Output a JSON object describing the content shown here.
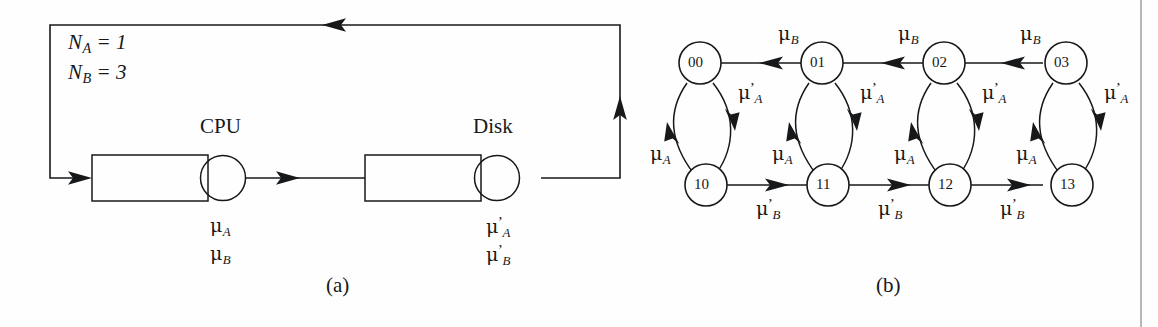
{
  "figure": {
    "panels": [
      {
        "id": "a",
        "caption": "(a)",
        "type": "closed-queueing-network",
        "population_labels": [
          {
            "name": "N_A",
            "text": "N",
            "subscript": "A",
            "equals": "= 1",
            "value": 1
          },
          {
            "name": "N_B",
            "text": "N",
            "subscript": "B",
            "equals": "= 3",
            "value": 3
          }
        ],
        "stations": [
          {
            "name": "CPU",
            "label": "CPU",
            "rates": [
              {
                "base": "μ",
                "subscript": "A",
                "prime": false,
                "display": "μA"
              },
              {
                "base": "μ",
                "subscript": "B",
                "prime": false,
                "display": "μB"
              }
            ]
          },
          {
            "name": "Disk",
            "label": "Disk",
            "rates": [
              {
                "base": "μ",
                "subscript": "A",
                "prime": true,
                "display": "μ'A"
              },
              {
                "base": "μ",
                "subscript": "B",
                "prime": true,
                "display": "μ'B"
              }
            ]
          }
        ]
      },
      {
        "id": "b",
        "caption": "(b)",
        "type": "markov-state-transition-diagram",
        "nodes": [
          {
            "id": "00",
            "label": "00",
            "row": "top",
            "col": 0
          },
          {
            "id": "01",
            "label": "01",
            "row": "top",
            "col": 1
          },
          {
            "id": "02",
            "label": "02",
            "row": "top",
            "col": 2
          },
          {
            "id": "03",
            "label": "03",
            "row": "top",
            "col": 3
          },
          {
            "id": "10",
            "label": "10",
            "row": "bottom",
            "col": 0
          },
          {
            "id": "11",
            "label": "11",
            "row": "bottom",
            "col": 1
          },
          {
            "id": "12",
            "label": "12",
            "row": "bottom",
            "col": 2
          },
          {
            "id": "13",
            "label": "13",
            "row": "bottom",
            "col": 3
          }
        ],
        "edges": [
          {
            "from": "01",
            "to": "00",
            "label": "μB",
            "base": "μ",
            "subscript": "B",
            "prime": false
          },
          {
            "from": "02",
            "to": "01",
            "label": "μB",
            "base": "μ",
            "subscript": "B",
            "prime": false
          },
          {
            "from": "03",
            "to": "02",
            "label": "μB",
            "base": "μ",
            "subscript": "B",
            "prime": false
          },
          {
            "from": "10",
            "to": "11",
            "label": "μ'B",
            "base": "μ",
            "subscript": "B",
            "prime": true
          },
          {
            "from": "11",
            "to": "12",
            "label": "μ'B",
            "base": "μ",
            "subscript": "B",
            "prime": true
          },
          {
            "from": "12",
            "to": "13",
            "label": "μ'B",
            "base": "μ",
            "subscript": "B",
            "prime": true
          },
          {
            "from": "00",
            "to": "10",
            "label": "μ'A",
            "base": "μ",
            "subscript": "A",
            "prime": true
          },
          {
            "from": "01",
            "to": "11",
            "label": "μ'A",
            "base": "μ",
            "subscript": "A",
            "prime": true
          },
          {
            "from": "02",
            "to": "12",
            "label": "μ'A",
            "base": "μ",
            "subscript": "A",
            "prime": true
          },
          {
            "from": "03",
            "to": "13",
            "label": "μ'A",
            "base": "μ",
            "subscript": "A",
            "prime": true
          },
          {
            "from": "10",
            "to": "00",
            "label": "μA",
            "base": "μ",
            "subscript": "A",
            "prime": false
          },
          {
            "from": "11",
            "to": "01",
            "label": "μA",
            "base": "μ",
            "subscript": "A",
            "prime": false
          },
          {
            "from": "12",
            "to": "02",
            "label": "μA",
            "base": "μ",
            "subscript": "A",
            "prime": false
          },
          {
            "from": "13",
            "to": "03",
            "label": "μA",
            "base": "μ",
            "subscript": "A",
            "prime": false
          }
        ]
      }
    ],
    "colors": {
      "ink": "#16181a",
      "background": "#fefefe",
      "page_edge": "#b7b7b7"
    }
  },
  "text": {
    "mu": "μ",
    "N": "N",
    "sub_A": "A",
    "sub_B": "B",
    "prime": "’",
    "eq_1": "= 1",
    "eq_3": "= 3",
    "cpu": "CPU",
    "disk": "Disk",
    "caption_a": "(a)",
    "caption_b": "(b)",
    "n00": "00",
    "n01": "01",
    "n02": "02",
    "n03": "03",
    "n10": "10",
    "n11": "11",
    "n12": "12",
    "n13": "13"
  }
}
